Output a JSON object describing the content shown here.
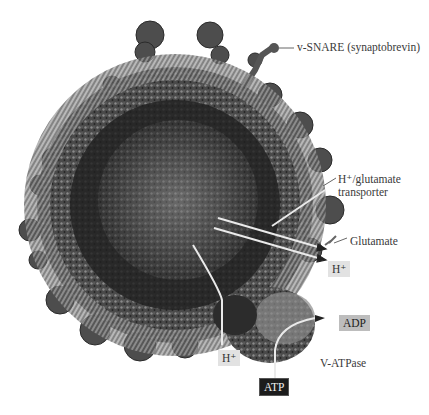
{
  "figure": {
    "colors": {
      "background": "#ffffff",
      "vesicle_dark": "#2a2a2a",
      "vesicle_mid": "#6e6e6e",
      "vesicle_light": "#a8a8a8",
      "label_text": "#3a3a3a",
      "box_light": "#e2e2e2",
      "box_mid": "#bdbdbd",
      "box_dark": "#1c1c1c"
    }
  },
  "labels": {
    "v_snare": "v-SNARE (synaptobrevin)",
    "transporter_line1": "H⁺/glutamate",
    "transporter_line2": "transporter",
    "glutamate": "Glutamate",
    "h_plus_out": "H⁺",
    "adp": "ADP",
    "v_atpase": "V-ATPase",
    "h_plus_in": "H⁺",
    "atp": "ATP"
  }
}
